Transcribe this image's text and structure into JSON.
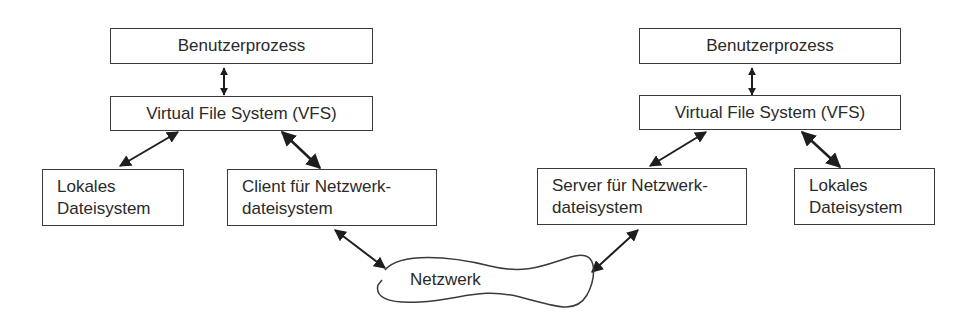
{
  "diagram": {
    "left": {
      "user_process": "Benutzerprozess",
      "vfs": "Virtual File System (VFS)",
      "local_fs": [
        "Lokales",
        "Dateisystem"
      ],
      "network_fs": [
        "Client für Netzwerk-",
        "dateisystem"
      ]
    },
    "right": {
      "user_process": "Benutzerprozess",
      "vfs": "Virtual File System (VFS)",
      "network_fs": [
        "Server für Netzwerk-",
        "dateisystem"
      ],
      "local_fs": [
        "Lokales",
        "Dateisystem"
      ]
    },
    "network": "Netzwerk",
    "colors": {
      "line": "#3a3a3a",
      "arrow": "#1e1e1e",
      "text": "#2a2a2a"
    }
  }
}
